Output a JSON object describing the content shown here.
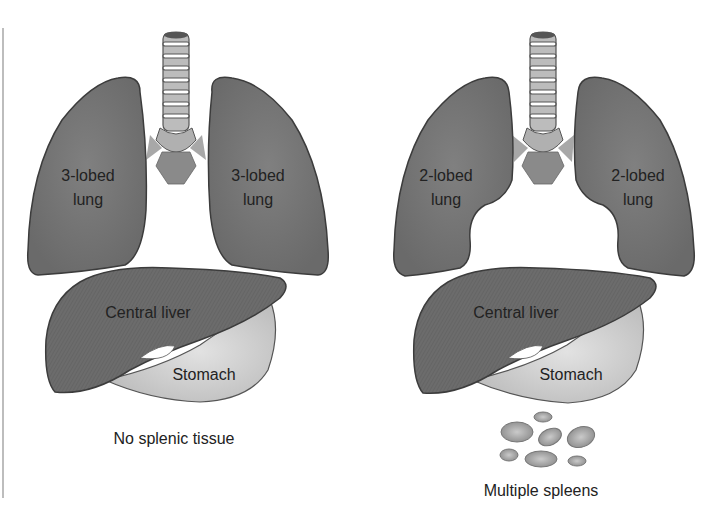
{
  "panels": [
    {
      "id": "left",
      "lungs": {
        "left_label_1": "3-lobed",
        "left_label_2": "lung",
        "right_label_1": "3-lobed",
        "right_label_2": "lung"
      },
      "liver": "Central liver",
      "stomach": "Stomach",
      "caption": "No splenic tissue"
    },
    {
      "id": "right",
      "lungs": {
        "left_label_1": "2-lobed",
        "left_label_2": "lung",
        "right_label_1": "2-lobed",
        "right_label_2": "lung"
      },
      "liver": "Central liver",
      "stomach": "Stomach",
      "caption": "Multiple spleens"
    }
  ],
  "colors": {
    "organ_dark": "#6e6e6e",
    "organ_outline": "#3c3c3c",
    "stomach": "#cfcfcf",
    "trachea": "#b5b5b5",
    "spleen": "#a9a9a9"
  }
}
